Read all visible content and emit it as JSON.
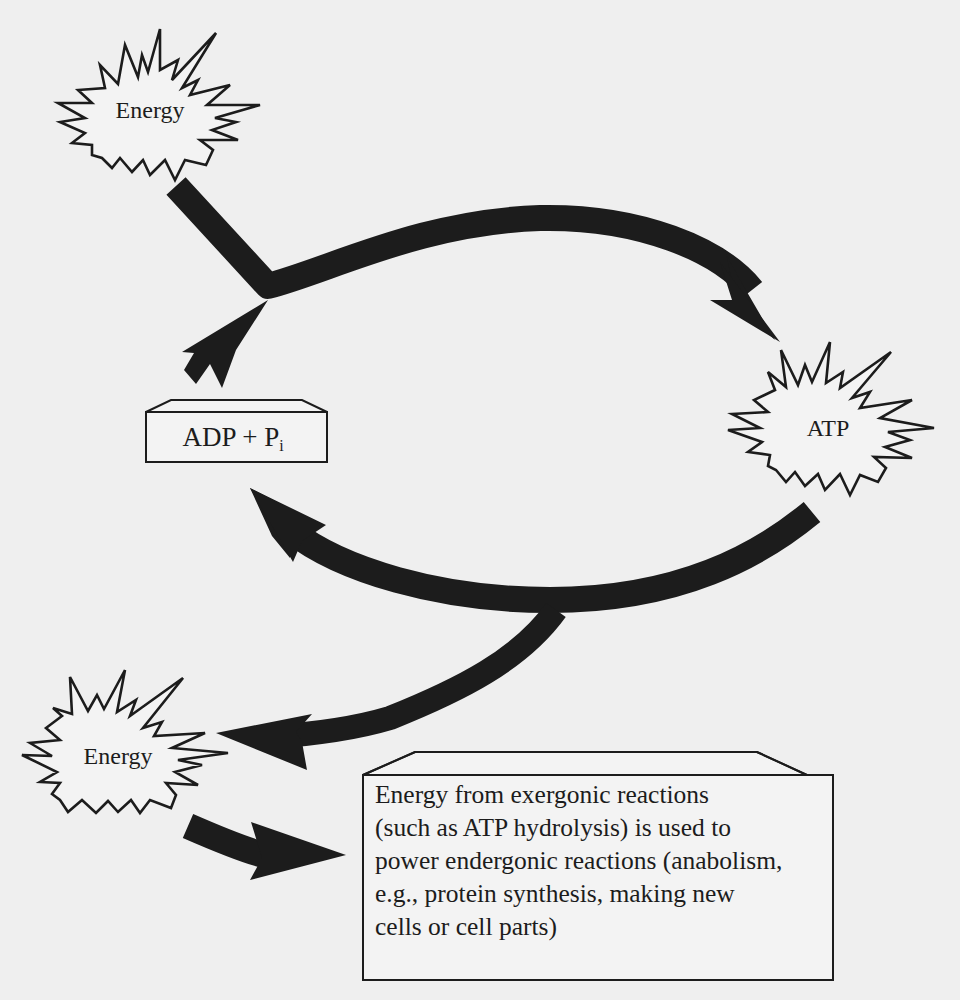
{
  "diagram": {
    "nodes": {
      "energy_top": {
        "label": "Energy",
        "shape": "burst"
      },
      "atp": {
        "label": "ATP",
        "shape": "burst"
      },
      "adp": {
        "label_main": "ADP + P",
        "label_sub": "i",
        "shape": "box"
      },
      "energy_bottom": {
        "label": "Energy",
        "shape": "burst"
      }
    },
    "explanation": {
      "lines": [
        "Energy from exergonic reactions",
        "(such as ATP hydrolysis) is used to",
        "power endergonic reactions (anabolism,",
        "e.g., protein synthesis, making new",
        "cells or cell parts)"
      ]
    },
    "arrows": [
      {
        "from": "energy_top",
        "to": "atp",
        "via": "junction"
      },
      {
        "from": "adp",
        "to": "atp",
        "via": "junction"
      },
      {
        "from": "atp",
        "to": "adp"
      },
      {
        "from": "atp",
        "to": "energy_bottom"
      },
      {
        "from": "energy_bottom",
        "to": "explanation"
      }
    ],
    "colors": {
      "background": "#efefef",
      "ink": "#1c1c1c",
      "shape_fill": "#f3f3f3"
    }
  }
}
